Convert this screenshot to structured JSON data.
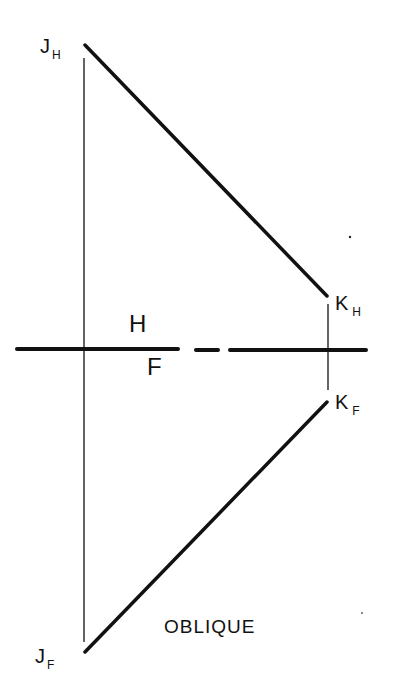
{
  "diagram": {
    "title": "OBLIQUE",
    "colors": {
      "ink": "#111111",
      "background": "#ffffff"
    },
    "points": {
      "JH": {
        "letter": "J",
        "subscript": "H"
      },
      "KH": {
        "letter": "K",
        "subscript": "H"
      },
      "KF": {
        "letter": "K",
        "subscript": "F"
      },
      "JF": {
        "letter": "J",
        "subscript": "F"
      }
    },
    "planes": {
      "upper": "H",
      "lower": "F"
    }
  }
}
